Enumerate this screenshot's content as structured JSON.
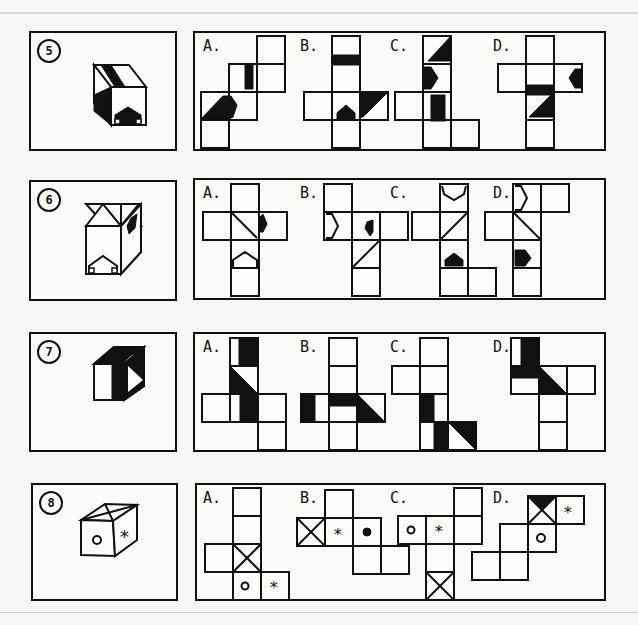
{
  "worksheet": {
    "title": "Cube net matching exercises",
    "questions": [
      {
        "number": "5",
        "options": [
          {
            "label": "A."
          },
          {
            "label": "B."
          },
          {
            "label": "C."
          },
          {
            "label": "D."
          }
        ]
      },
      {
        "number": "6",
        "options": [
          {
            "label": "A."
          },
          {
            "label": "B."
          },
          {
            "label": "C."
          },
          {
            "label": "D."
          }
        ]
      },
      {
        "number": "7",
        "options": [
          {
            "label": "A."
          },
          {
            "label": "B."
          },
          {
            "label": "C."
          },
          {
            "label": "D."
          }
        ]
      },
      {
        "number": "8",
        "options": [
          {
            "label": "A."
          },
          {
            "label": "B."
          },
          {
            "label": "C."
          },
          {
            "label": "D."
          }
        ]
      }
    ],
    "symbols": {
      "circle": "o",
      "asterisk": "*"
    },
    "colors": {
      "ink": "#111111",
      "paper": "#fbfbfa"
    }
  }
}
